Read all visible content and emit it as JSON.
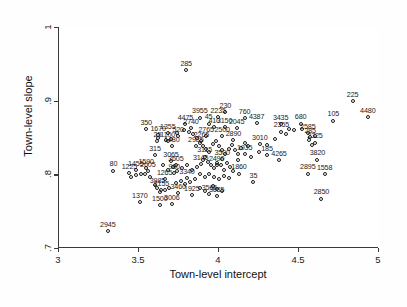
{
  "chart_data": {
    "type": "scatter",
    "title": "",
    "xlabel": "Town-level intercept",
    "ylabel": "Town-level slope",
    "xlim": [
      3,
      5
    ],
    "ylim": [
      0.7,
      1.0
    ],
    "xticks": [
      "3",
      "3.5",
      "4",
      "4.5",
      "5"
    ],
    "xtickvalues": [
      3,
      3.5,
      4,
      4.5,
      5
    ],
    "yticks": [
      "1",
      ".9",
      ".8",
      ".7"
    ],
    "ytickvalues": [
      1,
      0.9,
      0.8,
      0.7
    ],
    "grid": false,
    "legend": null,
    "marker": "open-circle",
    "point_label_position": "above",
    "points": [
      {
        "label": "285",
        "x": 3.795,
        "y": 0.942
      },
      {
        "label": "225",
        "x": 4.835,
        "y": 0.899
      },
      {
        "label": "4480",
        "x": 4.93,
        "y": 0.878
      },
      {
        "label": "105",
        "x": 4.715,
        "y": 0.873
      },
      {
        "label": "350",
        "x": 3.545,
        "y": 0.861
      },
      {
        "label": "3955",
        "x": 3.88,
        "y": 0.877
      },
      {
        "label": "230",
        "x": 4.04,
        "y": 0.884
      },
      {
        "label": "2235",
        "x": 3.995,
        "y": 0.878
      },
      {
        "label": "760",
        "x": 4.16,
        "y": 0.876
      },
      {
        "label": "4475",
        "x": 3.79,
        "y": 0.868
      },
      {
        "label": "45",
        "x": 3.935,
        "y": 0.869
      },
      {
        "label": "4387",
        "x": 4.235,
        "y": 0.87
      },
      {
        "label": "3435",
        "x": 4.385,
        "y": 0.868
      },
      {
        "label": "680",
        "x": 4.51,
        "y": 0.869
      },
      {
        "label": "2740",
        "x": 3.825,
        "y": 0.863
      },
      {
        "label": "410",
        "x": 3.97,
        "y": 0.864
      },
      {
        "label": "3150",
        "x": 4.035,
        "y": 0.864
      },
      {
        "label": "2045",
        "x": 4.11,
        "y": 0.863
      },
      {
        "label": "1355",
        "x": 3.68,
        "y": 0.856
      },
      {
        "label": "1670",
        "x": 3.62,
        "y": 0.853
      },
      {
        "label": "2355",
        "x": 4.39,
        "y": 0.858
      },
      {
        "label": "2585",
        "x": 4.555,
        "y": 0.856
      },
      {
        "label": "520",
        "x": 3.745,
        "y": 0.852
      },
      {
        "label": "2765",
        "x": 3.92,
        "y": 0.852
      },
      {
        "label": "2500",
        "x": 4.02,
        "y": 0.852
      },
      {
        "label": "285b",
        "x": 4.57,
        "y": 0.851
      },
      {
        "label": "25",
        "x": 3.615,
        "y": 0.845
      },
      {
        "label": "1100",
        "x": 3.68,
        "y": 0.845
      },
      {
        "label": "2265",
        "x": 3.89,
        "y": 0.845
      },
      {
        "label": "2890",
        "x": 4.09,
        "y": 0.846
      },
      {
        "label": "2325",
        "x": 4.6,
        "y": 0.843
      },
      {
        "label": "1480",
        "x": 3.705,
        "y": 0.838
      },
      {
        "label": "2985",
        "x": 3.855,
        "y": 0.838
      },
      {
        "label": "3010",
        "x": 4.255,
        "y": 0.841
      },
      {
        "label": "315",
        "x": 3.6,
        "y": 0.826
      },
      {
        "label": "1935",
        "x": 4.16,
        "y": 0.827
      },
      {
        "label": "185",
        "x": 4.3,
        "y": 0.826
      },
      {
        "label": "3820",
        "x": 4.615,
        "y": 0.82
      },
      {
        "label": "3115",
        "x": 3.91,
        "y": 0.824
      },
      {
        "label": "3500",
        "x": 4.02,
        "y": 0.821
      },
      {
        "label": "4265",
        "x": 4.375,
        "y": 0.819
      },
      {
        "label": "3065",
        "x": 3.7,
        "y": 0.818
      },
      {
        "label": "3605",
        "x": 3.73,
        "y": 0.813
      },
      {
        "label": "3145",
        "x": 3.885,
        "y": 0.814
      },
      {
        "label": "2490",
        "x": 3.985,
        "y": 0.812
      },
      {
        "label": "1590",
        "x": 3.545,
        "y": 0.809
      },
      {
        "label": "1455",
        "x": 3.48,
        "y": 0.806
      },
      {
        "label": "80",
        "x": 3.34,
        "y": 0.805
      },
      {
        "label": "1225",
        "x": 3.44,
        "y": 0.802
      },
      {
        "label": "2605",
        "x": 3.555,
        "y": 0.804
      },
      {
        "label": "980",
        "x": 3.72,
        "y": 0.802
      },
      {
        "label": "1860",
        "x": 4.125,
        "y": 0.801
      },
      {
        "label": "2895",
        "x": 4.555,
        "y": 0.801
      },
      {
        "label": "1558",
        "x": 4.66,
        "y": 0.8
      },
      {
        "label": "1265",
        "x": 3.66,
        "y": 0.794
      },
      {
        "label": "3340",
        "x": 3.8,
        "y": 0.795
      },
      {
        "label": "35",
        "x": 4.215,
        "y": 0.79
      },
      {
        "label": "3985",
        "x": 3.615,
        "y": 0.782
      },
      {
        "label": "2155",
        "x": 3.64,
        "y": 0.779
      },
      {
        "label": "3460",
        "x": 3.745,
        "y": 0.775
      },
      {
        "label": "1925",
        "x": 3.83,
        "y": 0.772
      },
      {
        "label": "3565",
        "x": 3.94,
        "y": 0.773
      },
      {
        "label": "3685",
        "x": 3.985,
        "y": 0.771
      },
      {
        "label": "2850",
        "x": 4.64,
        "y": 0.767
      },
      {
        "label": "1370",
        "x": 3.505,
        "y": 0.762
      },
      {
        "label": "1500",
        "x": 3.63,
        "y": 0.758
      },
      {
        "label": "3006",
        "x": 3.705,
        "y": 0.76
      },
      {
        "label": "2945",
        "x": 3.305,
        "y": 0.723
      }
    ],
    "unlabeled_points": [
      {
        "x": 3.62,
        "y": 0.849
      },
      {
        "x": 3.67,
        "y": 0.847
      },
      {
        "x": 3.7,
        "y": 0.848
      },
      {
        "x": 3.74,
        "y": 0.856
      },
      {
        "x": 3.78,
        "y": 0.86
      },
      {
        "x": 3.81,
        "y": 0.858
      },
      {
        "x": 3.84,
        "y": 0.855
      },
      {
        "x": 3.86,
        "y": 0.849
      },
      {
        "x": 3.88,
        "y": 0.843
      },
      {
        "x": 3.9,
        "y": 0.838
      },
      {
        "x": 3.92,
        "y": 0.834
      },
      {
        "x": 3.94,
        "y": 0.83
      },
      {
        "x": 3.96,
        "y": 0.841
      },
      {
        "x": 3.98,
        "y": 0.845
      },
      {
        "x": 4.0,
        "y": 0.838
      },
      {
        "x": 4.02,
        "y": 0.833
      },
      {
        "x": 4.04,
        "y": 0.828
      },
      {
        "x": 4.06,
        "y": 0.835
      },
      {
        "x": 4.08,
        "y": 0.84
      },
      {
        "x": 4.1,
        "y": 0.833
      },
      {
        "x": 4.12,
        "y": 0.827
      },
      {
        "x": 4.14,
        "y": 0.836
      },
      {
        "x": 4.16,
        "y": 0.843
      },
      {
        "x": 4.18,
        "y": 0.838
      },
      {
        "x": 3.9,
        "y": 0.82
      },
      {
        "x": 3.93,
        "y": 0.817
      },
      {
        "x": 3.95,
        "y": 0.812
      },
      {
        "x": 3.97,
        "y": 0.808
      },
      {
        "x": 3.99,
        "y": 0.816
      },
      {
        "x": 4.01,
        "y": 0.812
      },
      {
        "x": 4.03,
        "y": 0.806
      },
      {
        "x": 4.05,
        "y": 0.816
      },
      {
        "x": 4.07,
        "y": 0.81
      },
      {
        "x": 4.09,
        "y": 0.804
      },
      {
        "x": 3.86,
        "y": 0.81
      },
      {
        "x": 3.83,
        "y": 0.806
      },
      {
        "x": 3.8,
        "y": 0.812
      },
      {
        "x": 3.77,
        "y": 0.808
      },
      {
        "x": 3.74,
        "y": 0.804
      },
      {
        "x": 3.71,
        "y": 0.81
      },
      {
        "x": 3.68,
        "y": 0.806
      },
      {
        "x": 3.65,
        "y": 0.812
      },
      {
        "x": 3.88,
        "y": 0.8
      },
      {
        "x": 3.91,
        "y": 0.797
      },
      {
        "x": 3.94,
        "y": 0.8
      },
      {
        "x": 3.97,
        "y": 0.796
      },
      {
        "x": 4.0,
        "y": 0.793
      },
      {
        "x": 4.03,
        "y": 0.798
      },
      {
        "x": 4.06,
        "y": 0.795
      },
      {
        "x": 3.85,
        "y": 0.793
      },
      {
        "x": 3.82,
        "y": 0.79
      },
      {
        "x": 3.79,
        "y": 0.787
      },
      {
        "x": 3.76,
        "y": 0.791
      },
      {
        "x": 3.73,
        "y": 0.788
      },
      {
        "x": 4.12,
        "y": 0.82
      },
      {
        "x": 4.2,
        "y": 0.824
      },
      {
        "x": 4.25,
        "y": 0.83
      },
      {
        "x": 4.3,
        "y": 0.84
      },
      {
        "x": 4.35,
        "y": 0.848
      },
      {
        "x": 4.42,
        "y": 0.855
      },
      {
        "x": 4.47,
        "y": 0.86
      },
      {
        "x": 4.52,
        "y": 0.861
      },
      {
        "x": 4.56,
        "y": 0.847
      },
      {
        "x": 4.58,
        "y": 0.84
      },
      {
        "x": 4.6,
        "y": 0.852
      },
      {
        "x": 4.44,
        "y": 0.862
      },
      {
        "x": 3.96,
        "y": 0.784
      },
      {
        "x": 3.99,
        "y": 0.78
      },
      {
        "x": 4.02,
        "y": 0.777
      },
      {
        "x": 3.88,
        "y": 0.781
      },
      {
        "x": 3.91,
        "y": 0.778
      },
      {
        "x": 3.69,
        "y": 0.782
      },
      {
        "x": 3.66,
        "y": 0.779
      },
      {
        "x": 3.63,
        "y": 0.776
      },
      {
        "x": 3.6,
        "y": 0.786
      },
      {
        "x": 3.57,
        "y": 0.796
      },
      {
        "x": 3.54,
        "y": 0.8
      },
      {
        "x": 3.51,
        "y": 0.801
      },
      {
        "x": 3.48,
        "y": 0.799
      },
      {
        "x": 3.45,
        "y": 0.797
      }
    ]
  }
}
